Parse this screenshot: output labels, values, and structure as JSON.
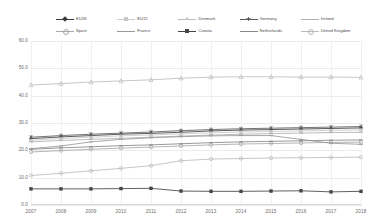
{
  "chart_data": {
    "type": "line",
    "title": "",
    "subtitle": "",
    "xlabel": "",
    "ylabel": "",
    "x": [
      2007,
      2008,
      2009,
      2010,
      2011,
      2012,
      2013,
      2014,
      2015,
      2016,
      2017,
      2018
    ],
    "xtick_labels": [
      "2007",
      "2008",
      "2009",
      "2010",
      "2011",
      "2012",
      "2013",
      "2014",
      "2015",
      "2016",
      "2017",
      "2018"
    ],
    "ytick_labels": [
      "0.0",
      "10.0",
      "20.0",
      "30.0",
      "40.0",
      "50.0",
      "60.0"
    ],
    "yticks": [
      0,
      10,
      20,
      30,
      40,
      50,
      60
    ],
    "ylim": [
      0,
      60
    ],
    "xlim": [
      2007,
      2018
    ],
    "grid": true,
    "legend_position": "top",
    "legend_columns": 5,
    "series": [
      {
        "name": "EU28",
        "color": "#3c3c3c",
        "marker": "diamond",
        "values": [
          24.3,
          24.9,
          25.4,
          25.9,
          26.2,
          26.6,
          27.1,
          27.4,
          27.6,
          27.8,
          28.0,
          28.2
        ]
      },
      {
        "name": "EU15",
        "color": "#c9c9c9",
        "marker": "square",
        "values": [
          23.7,
          24.3,
          24.8,
          25.3,
          25.6,
          26.0,
          26.4,
          26.7,
          26.9,
          27.1,
          27.3,
          27.5
        ]
      },
      {
        "name": "Denmark",
        "color": "#bdbdbd",
        "marker": "triangle",
        "values": [
          43.9,
          44.4,
          45.0,
          45.4,
          45.8,
          46.4,
          46.8,
          46.9,
          46.9,
          46.8,
          46.8,
          46.7
        ]
      },
      {
        "name": "Germany",
        "color": "#5c5c5c",
        "marker": "cross",
        "values": [
          24.8,
          25.4,
          25.9,
          26.3,
          26.7,
          27.2,
          27.6,
          27.9,
          28.1,
          28.3,
          28.5,
          28.7
        ]
      },
      {
        "name": "Ireland",
        "color": "#b0b0b0",
        "marker": "line",
        "values": [
          23.1,
          23.6,
          24.0,
          24.4,
          24.8,
          25.2,
          25.6,
          25.9,
          26.1,
          26.3,
          26.5,
          26.6
        ]
      },
      {
        "name": "Spain",
        "color": "#a8a8a8",
        "marker": "circle",
        "values": [
          19.4,
          19.9,
          20.4,
          20.8,
          21.2,
          21.6,
          22.0,
          22.3,
          22.5,
          22.7,
          22.9,
          23.0
        ]
      },
      {
        "name": "France",
        "color": "#9a9a9a",
        "marker": "line",
        "values": [
          20.6,
          21.6,
          23.1,
          24.0,
          24.6,
          25.0,
          25.3,
          25.4,
          25.4,
          24.0,
          22.6,
          22.2
        ]
      },
      {
        "name": "Croatia",
        "color": "#454545",
        "marker": "square",
        "values": [
          5.9,
          5.9,
          5.9,
          6.0,
          6.1,
          5.1,
          5.0,
          5.0,
          5.1,
          5.2,
          4.8,
          5.0
        ]
      },
      {
        "name": "Netherlands",
        "color": "#888888",
        "marker": "line",
        "values": [
          20.4,
          20.9,
          21.3,
          21.7,
          22.0,
          22.4,
          22.8,
          23.1,
          23.3,
          23.5,
          23.7,
          23.8
        ]
      },
      {
        "name": "United Kingdom",
        "color": "#bcbcbc",
        "marker": "circle",
        "values": [
          10.8,
          11.6,
          12.5,
          13.4,
          14.4,
          16.2,
          16.8,
          17.0,
          17.2,
          17.3,
          17.4,
          17.5
        ]
      }
    ]
  }
}
